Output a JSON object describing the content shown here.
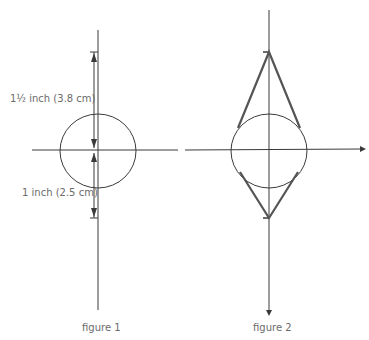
{
  "figures": [
    {
      "caption": "figure 1",
      "labels": {
        "upper_dimension": "1½ inch (3.8 cm)",
        "lower_dimension": "1 inch (2.5 cm)"
      }
    },
    {
      "caption": "figure 2"
    }
  ],
  "colors": {
    "line": "#3a3a3a",
    "thick_line": "#555555",
    "text": "#6b6b6b"
  }
}
